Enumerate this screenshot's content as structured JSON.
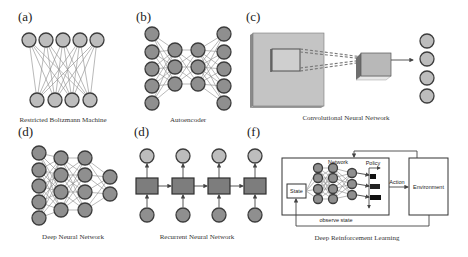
{
  "figure": {
    "panels": [
      {
        "id": "a",
        "label": "(a)",
        "caption": "Restricted Boltzmann Machine"
      },
      {
        "id": "b",
        "label": "(b)",
        "caption": "Autoencoder"
      },
      {
        "id": "c",
        "label": "(c)",
        "caption": "Convolutional Neural Network"
      },
      {
        "id": "d1",
        "label": "(d)",
        "caption": "Deep Neural Network"
      },
      {
        "id": "d2",
        "label": "(d)",
        "caption": "Recurrent Neural Network"
      },
      {
        "id": "f",
        "label": "(f)",
        "caption": "Deep Reinforcement Learning"
      }
    ],
    "drl": {
      "state": "State",
      "network": "Network",
      "policy": "Policy",
      "action": "Action",
      "environment": "Environment",
      "observe": "observe state"
    },
    "colors": {
      "node_fill": "#bdbdbd",
      "node_dark": "#8f8f8f",
      "outline": "#3c3c3c",
      "cnn_plane": "#c4c4c4"
    }
  }
}
